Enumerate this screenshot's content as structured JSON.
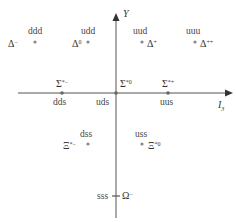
{
  "axes": {
    "vertical_label": "Y",
    "horizontal_label": "I",
    "horizontal_subscript": "3"
  },
  "particles": [
    {
      "quarks": "ddd",
      "symbol": "Δ",
      "charge": "−",
      "row": "top"
    },
    {
      "quarks": "udd",
      "symbol": "Δ",
      "charge": "0",
      "row": "top"
    },
    {
      "quarks": "uud",
      "symbol": "Δ",
      "charge": "+",
      "row": "top"
    },
    {
      "quarks": "uuu",
      "symbol": "Δ",
      "charge": "++",
      "row": "top"
    },
    {
      "quarks": "dds",
      "symbol": "Σ",
      "charge": "*−",
      "row": "middle"
    },
    {
      "quarks": "uds",
      "symbol": "Σ",
      "charge": "*0",
      "row": "middle"
    },
    {
      "quarks": "uus",
      "symbol": "Σ",
      "charge": "*+",
      "row": "middle"
    },
    {
      "quarks": "dss",
      "symbol": "Ξ",
      "charge": "*−",
      "row": "lower"
    },
    {
      "quarks": "uss",
      "symbol": "Ξ",
      "charge": "*0",
      "row": "lower"
    },
    {
      "quarks": "sss",
      "symbol": "Ω",
      "charge": "−",
      "row": "bottom"
    }
  ],
  "colors": {
    "axis": "#555555",
    "dot": "#888888",
    "text": "#333333"
  }
}
